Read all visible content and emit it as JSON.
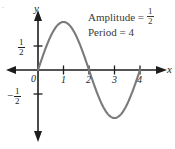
{
  "figure": {
    "background_color": "#ffffff",
    "curve_color": "#7a7a7a",
    "axis_color": "#1d1d1d",
    "text_color": "#3a3a3a",
    "corner_mark": "."
  },
  "annotations": {
    "amplitude": {
      "label": "Amplitude =",
      "value_numerator": "1",
      "value_denominator": "2"
    },
    "period": {
      "label": "Period = 4"
    }
  },
  "axes": {
    "x_axis_name": "x",
    "y_axis_name": "y",
    "origin_label": "0",
    "x_tick_labels": [
      "1",
      "2",
      "3",
      "4"
    ],
    "y_tick_positive": {
      "numerator": "1",
      "denominator": "2"
    },
    "y_tick_negative": {
      "minus": "−",
      "numerator": "1",
      "denominator": "2"
    }
  },
  "chart_data": {
    "type": "line",
    "title": "",
    "xlabel": "x",
    "ylabel": "y",
    "xlim": [
      -1.2,
      5.4
    ],
    "ylim": [
      -1.2,
      1.2
    ],
    "xticks": [
      0,
      1,
      2,
      3,
      4
    ],
    "xticklabels": [
      "0",
      "1",
      "2",
      "3",
      "4"
    ],
    "yticks": [
      -0.5,
      0.5
    ],
    "yticklabels": [
      "-1/2",
      "1/2"
    ],
    "grid": false,
    "legend": null,
    "annotations": [
      "Amplitude = 1/2",
      "Period = 4"
    ],
    "series": [
      {
        "name": "y = (1/2) sin(pi*x/2)",
        "amplitude": 0.5,
        "period": 4,
        "color": "#7a7a7a",
        "x": [
          0,
          0.25,
          0.5,
          0.75,
          1,
          1.25,
          1.5,
          1.75,
          2,
          2.25,
          2.5,
          2.75,
          3,
          3.25,
          3.5,
          3.75,
          4
        ],
        "y": [
          0,
          0.191,
          0.354,
          0.462,
          0.5,
          0.462,
          0.354,
          0.191,
          0,
          -0.191,
          -0.354,
          -0.462,
          -0.5,
          -0.462,
          -0.354,
          -0.191,
          0
        ]
      }
    ]
  }
}
